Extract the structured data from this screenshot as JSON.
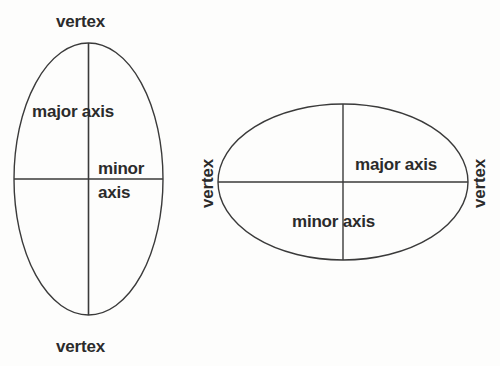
{
  "figure": {
    "background_color": "#fdfdfc",
    "stroke_color": "#3a3a3a",
    "text_color": "#2b2b2b",
    "shapes": [
      {
        "name": "vertical-ellipse",
        "orientation": "vertical",
        "center": [
          88.5,
          179
        ],
        "rx": 74.5,
        "ry": 136,
        "major_axis": "vertical",
        "minor_axis": "horizontal"
      },
      {
        "name": "horizontal-ellipse",
        "orientation": "horizontal",
        "center": [
          343,
          182
        ],
        "rx": 125,
        "ry": 78,
        "major_axis": "horizontal",
        "minor_axis": "vertical"
      }
    ]
  },
  "left_ellipse": {
    "vertex_top_label": "vertex",
    "vertex_bottom_label": "vertex",
    "major_axis_label": "major axis",
    "minor_label_line1": "minor",
    "minor_label_line2": "axis"
  },
  "right_ellipse": {
    "vertex_left_label": "vertex",
    "vertex_right_label": "vertex",
    "major_axis_label": "major axis",
    "minor_axis_label": "minor axis"
  }
}
